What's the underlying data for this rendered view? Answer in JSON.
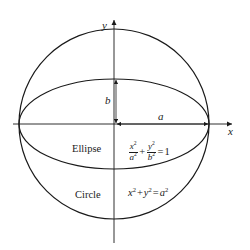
{
  "figure": {
    "background_color": "#ffffff",
    "stroke_color": "#1a1a1a",
    "axes": {
      "x_label": "x",
      "y_label": "y",
      "origin": {
        "x": 114,
        "y": 124
      },
      "x_axis_start": 13,
      "x_axis_end": 236,
      "y_axis_start": 16,
      "y_axis_end": 243
    },
    "shapes": {
      "circle": {
        "name": "Circle",
        "center_x": 114,
        "center_y": 124,
        "radius": 95,
        "equation_parts": {
          "x_term": "x",
          "y_term": "y",
          "rhs_var": "a",
          "plus": "+",
          "equals": "="
        }
      },
      "ellipse": {
        "name": "Ellipse",
        "center_x": 114,
        "center_y": 124,
        "semi_major_a": 95,
        "semi_minor_b": 45,
        "equation_parts": {
          "x_num": "x",
          "x_den": "a",
          "y_num": "y",
          "y_den": "b",
          "plus": "+",
          "equals": "=",
          "rhs": "1"
        }
      }
    },
    "dimensions": {
      "semi_minor_label": "b",
      "semi_major_label": "a",
      "b_arrow": {
        "x": 116,
        "y_top": 79,
        "y_bottom": 124
      },
      "a_arrow": {
        "y": 124,
        "x_left": 116,
        "x_right": 209
      }
    },
    "labels": {
      "ellipse_name": "Ellipse",
      "circle_name": "Circle"
    }
  }
}
